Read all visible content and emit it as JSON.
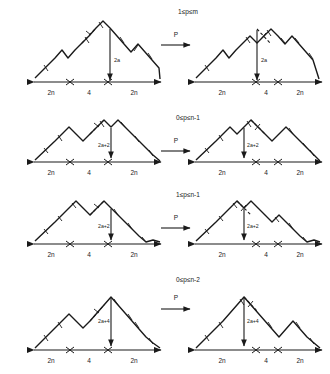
{
  "figure": {
    "type": "diagram",
    "map_label": "P",
    "baseline_labels": [
      "2n",
      "4",
      "2n"
    ],
    "rows": [
      {
        "id": "row-1",
        "condition": "1≤p≤m",
        "arrow_label": "P",
        "left": {
          "height_label": "2a",
          "baseline": [
            "2n",
            "4",
            "2n"
          ]
        },
        "right": {
          "height_label": "2a",
          "baseline": [
            "2n",
            "4",
            "2n"
          ]
        }
      },
      {
        "id": "row-2",
        "condition": "0≤p≤n-1",
        "arrow_label": "P",
        "left": {
          "height_label": "2a+2",
          "baseline": [
            "2n",
            "4",
            "2n"
          ]
        },
        "right": {
          "height_label": "2a+2",
          "baseline": [
            "2n",
            "4",
            "2n"
          ]
        }
      },
      {
        "id": "row-3",
        "condition": "1≤p≤n-1",
        "arrow_label": "P",
        "left": {
          "height_label": "2a+2",
          "baseline": [
            "2n",
            "4",
            "2n"
          ]
        },
        "right": {
          "height_label": "2a+2",
          "baseline": [
            "2n",
            "4",
            "2n"
          ]
        }
      },
      {
        "id": "row-4",
        "condition": "0≤p≤n-2",
        "arrow_label": "P",
        "left": {
          "height_label": "2a+4",
          "baseline": [
            "2n",
            "4",
            "2n"
          ]
        },
        "right": {
          "height_label": "2a+4",
          "baseline": [
            "2n",
            "4",
            "2n"
          ]
        }
      }
    ],
    "colors": {
      "ink": "#1a1a1a",
      "background": "#ffffff"
    }
  }
}
